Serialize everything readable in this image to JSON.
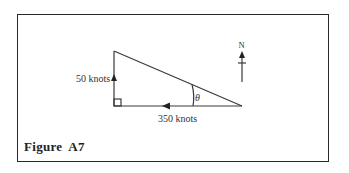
{
  "figure": {
    "caption": "Figure  A7",
    "vertical_label": "50 knots",
    "horizontal_label": "350 knots",
    "angle_label": "θ",
    "north_label": "N"
  },
  "colors": {
    "line": "#3a3a3a",
    "text": "#333333",
    "border": "#2a2a2a"
  }
}
